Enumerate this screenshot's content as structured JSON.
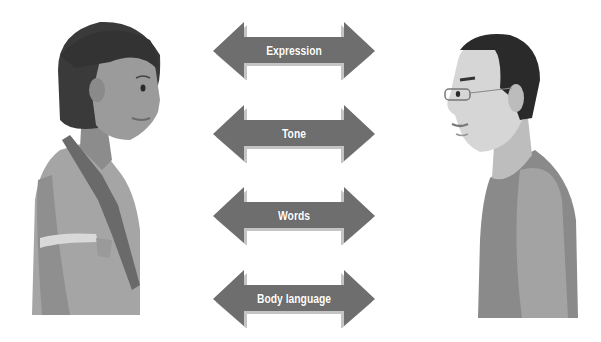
{
  "diagram": {
    "title": "",
    "participants": [
      {
        "id": "woman",
        "label": "",
        "facing": "right"
      },
      {
        "id": "man",
        "label": "",
        "facing": "left"
      }
    ],
    "arrows": [
      {
        "label": "Expression",
        "top": 22
      },
      {
        "label": "Tone",
        "top": 105
      },
      {
        "label": "Words",
        "top": 187
      },
      {
        "label": "Body language",
        "top": 270
      }
    ],
    "colors": {
      "arrow_fill": "#6e6e6e",
      "arrow_shadow": "#bdbdbd",
      "label_text": "#ffffff",
      "background": "#ffffff"
    }
  }
}
